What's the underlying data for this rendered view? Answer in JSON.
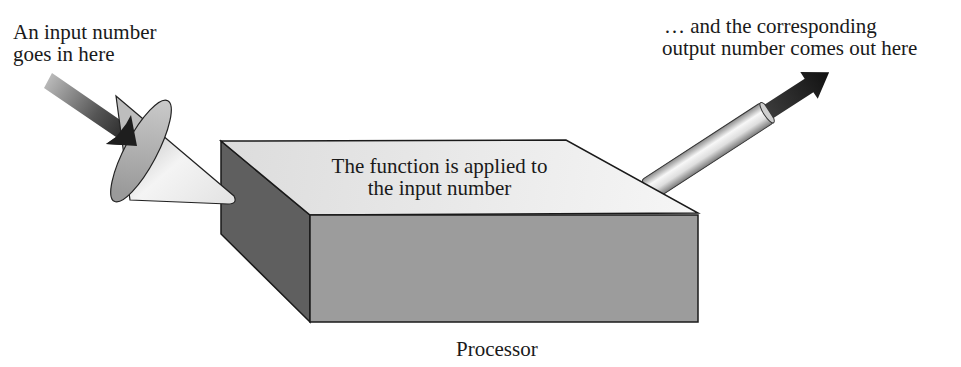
{
  "diagram": {
    "input": {
      "label_lines": [
        "An input number",
        "goes in here"
      ],
      "arrow_icon": "arrow-into-funnel-icon",
      "funnel_icon": "funnel-cone-icon"
    },
    "processor": {
      "top_text_lines": [
        "The function is applied to",
        "the input number"
      ],
      "caption": "Processor"
    },
    "output": {
      "label_lines": [
        "… and the corresponding",
        "output number comes out here"
      ],
      "pipe_icon": "output-pipe-icon",
      "arrow_icon": "arrow-out-icon"
    },
    "colors": {
      "background": "#ffffff",
      "outline": "#1a1a1a",
      "box_top": "#e6e6e6",
      "box_front": "#9a9a9a",
      "box_side": "#5e5e5e",
      "arrow_dark": "#222222",
      "arrow_light": "#b5b5b5"
    }
  }
}
